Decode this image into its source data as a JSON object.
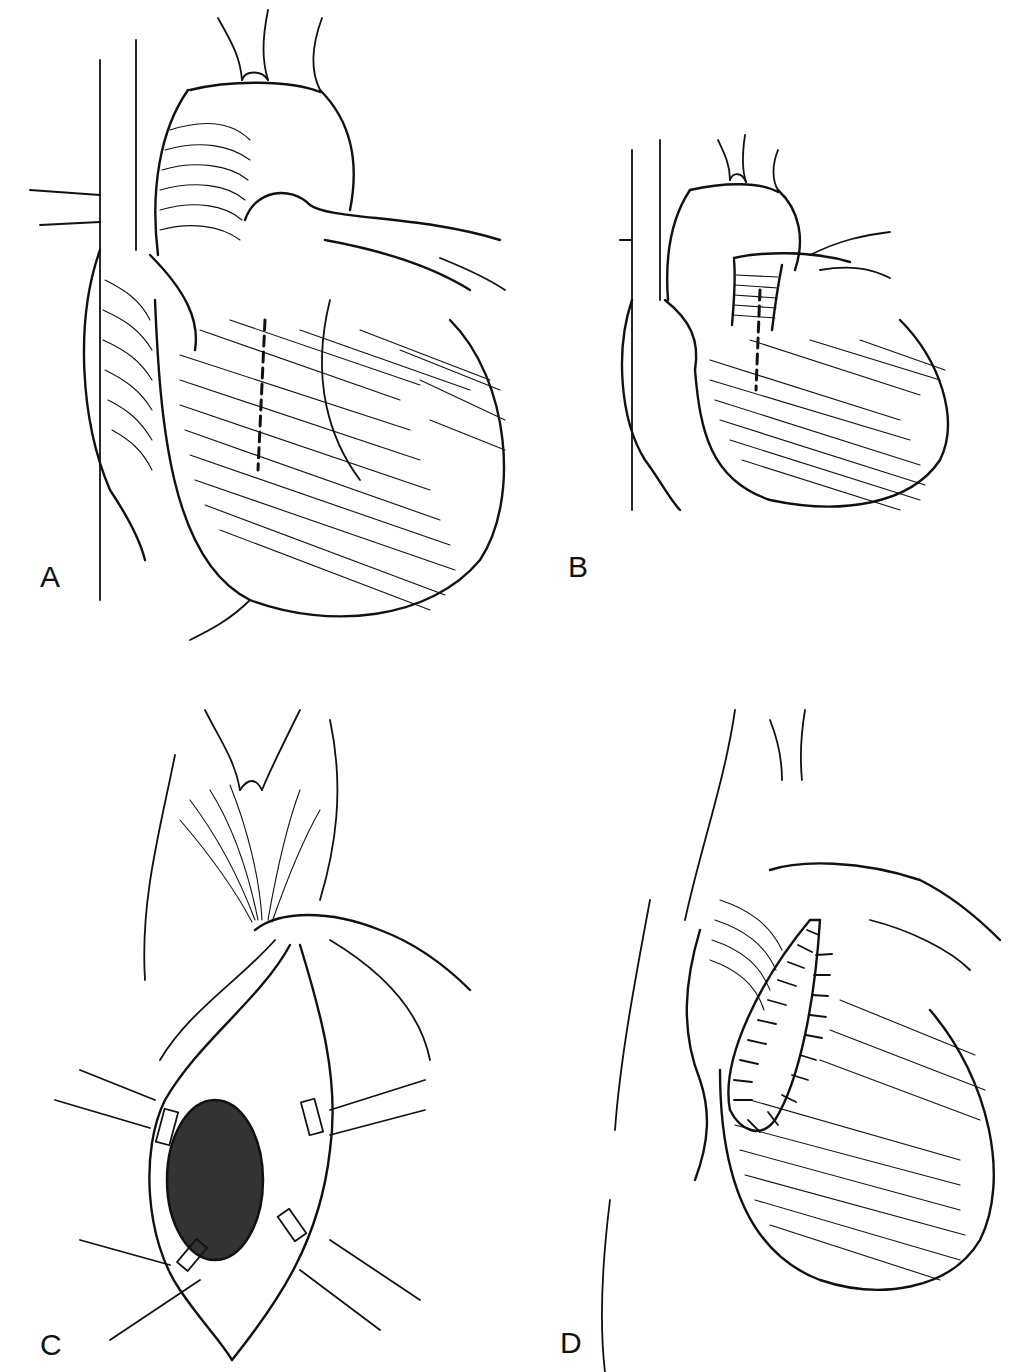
{
  "figure": {
    "panels": [
      {
        "id": "A",
        "label": "A",
        "caption_hint": "Anterior view of heart with dashed incision line on pulmonary outflow/right ventricle"
      },
      {
        "id": "B",
        "label": "B",
        "caption_hint": "Heart with transverse lines across pulmonary trunk and dashed incision line"
      },
      {
        "id": "C",
        "label": "C",
        "caption_hint": "Opened ventricle retracted with stay sutures exposing dark hatched defect"
      },
      {
        "id": "D",
        "label": "D",
        "caption_hint": "Heart with elongated patch sewn in place with continuous suture"
      }
    ]
  },
  "colors": {
    "ink": "#111111",
    "background": "#ffffff"
  }
}
